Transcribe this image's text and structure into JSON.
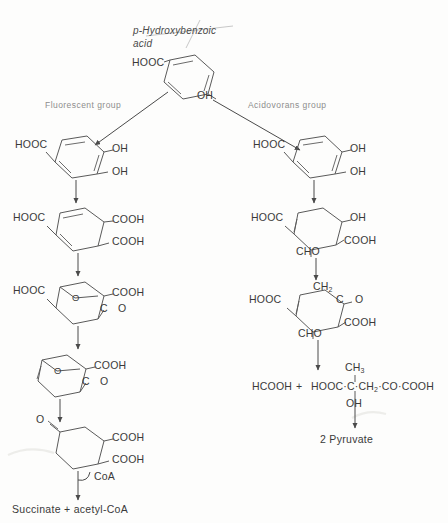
{
  "diagram": {
    "title": "p-Hydroxybenzoic acid",
    "title_line1": "p-Hydroxybenzoic",
    "title_line2": "acid",
    "branch_left_label": "Fluorescent group",
    "branch_right_label": "Acidovorans group"
  },
  "substrate": {
    "cooh": "HOOC",
    "oh": "OH"
  },
  "left_branch": {
    "step1": {
      "name": "protocatechuate",
      "cooh": "HOOC",
      "oh_top": "OH",
      "oh_bottom": "OH"
    },
    "step2": {
      "name": "beta-carboxy-cis,cis-muconate",
      "hooc": "HOOC",
      "cooh_top": "COOH",
      "cooh_bottom": "COOH"
    },
    "step3": {
      "name": "gamma-carboxymuconolactone",
      "hooc": "HOOC",
      "cooh": "COOH",
      "ring_o": "O",
      "carbonyl": "C",
      "carbonyl_o": "O"
    },
    "step4": {
      "name": "beta-ketoadipate enol-lactone",
      "cooh": "COOH",
      "ring_o": "O",
      "carbonyl": "C",
      "carbonyl_o": "O"
    },
    "step5": {
      "name": "beta-ketoadipate",
      "ketone_o": "O",
      "cooh_top": "COOH",
      "cooh_bottom": "COOH"
    },
    "cofactor": "CoA",
    "products": "Succinate + acetyl-CoA",
    "products_left": "Succinate",
    "products_plus": "+",
    "products_right": "acetyl-CoA"
  },
  "right_branch": {
    "step1": {
      "name": "protocatechuate",
      "cooh": "HOOC",
      "oh_top": "OH",
      "oh_bottom": "OH"
    },
    "step2": {
      "name": "ring-fission product",
      "hooc": "HOOC",
      "oh": "OH",
      "cooh": "COOH",
      "cho": "CHO"
    },
    "step3": {
      "name": "oxo acid",
      "hooc": "HOOC",
      "ch2": "CH",
      "ch2_sub": "2",
      "c": "C",
      "carbonyl_o": "O",
      "cooh": "COOH",
      "cho": "CHO"
    },
    "products": {
      "formate": "HCOOH",
      "plus": "+",
      "chain": "HOOC·C·CH",
      "chain_sub": "2",
      "chain_tail": "·CO·COOH",
      "methyl": "CH",
      "methyl_sub": "3",
      "hydroxyl": "OH"
    },
    "final": "2 Pyruvate"
  },
  "colors": {
    "background": "#fdfdfc",
    "bond": "#5a5a5a",
    "arrow": "#4a4a4a",
    "text": "#3a3a3a",
    "group_label": "#8d8d8d"
  }
}
